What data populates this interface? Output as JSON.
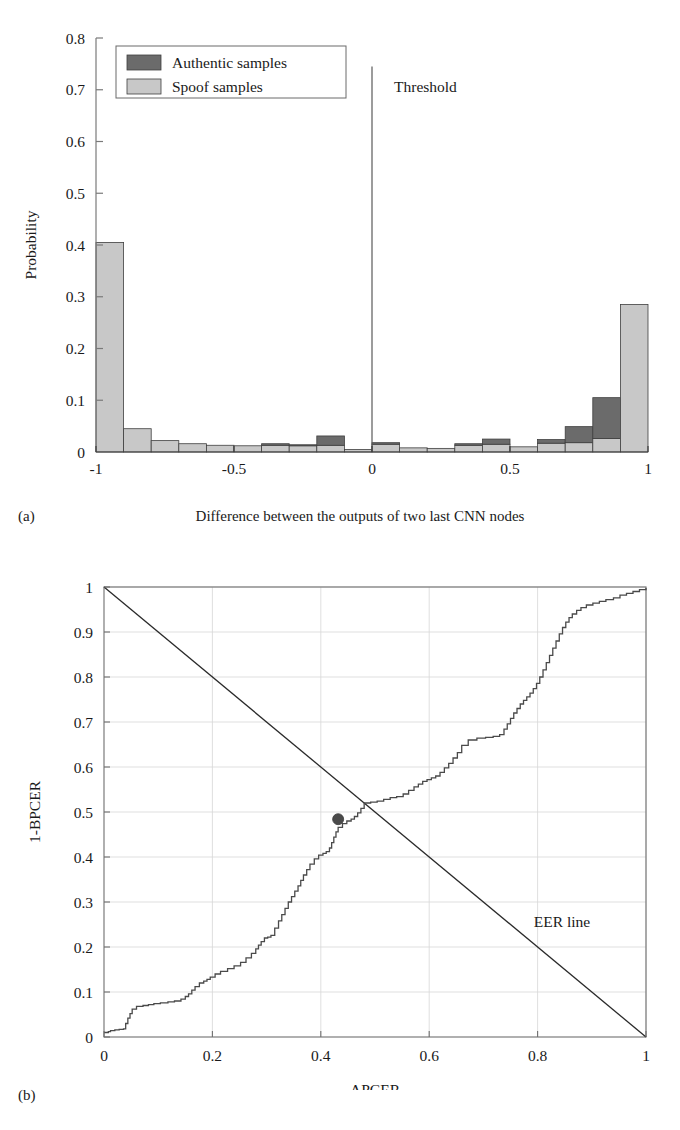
{
  "figure": {
    "panel_a": {
      "tag": "(a)",
      "caption": "Difference between the outputs of two last CNN nodes"
    },
    "panel_b": {
      "tag": "(b)",
      "caption": ""
    }
  },
  "chart_data": [
    {
      "id": "histogram-panel-a",
      "type": "bar",
      "title": "",
      "xlabel": "Difference between the outputs of two last CNN nodes",
      "ylabel": "Probability",
      "xlim": [
        -1,
        1
      ],
      "ylim": [
        0,
        0.8
      ],
      "grid": false,
      "stacked": true,
      "bin_width": 0.1,
      "x_ticks": [
        "-1",
        "-0.5",
        "0",
        "0.5",
        "1"
      ],
      "x_tick_values": [
        -1,
        -0.5,
        0,
        0.5,
        1
      ],
      "y_ticks": [
        "0",
        "0.1",
        "0.2",
        "0.3",
        "0.4",
        "0.5",
        "0.6",
        "0.7",
        "0.8"
      ],
      "y_tick_values": [
        0,
        0.1,
        0.2,
        0.3,
        0.4,
        0.5,
        0.6,
        0.7,
        0.8
      ],
      "bin_centers": [
        -0.95,
        -0.85,
        -0.75,
        -0.65,
        -0.55,
        -0.45,
        -0.35,
        -0.25,
        -0.15,
        -0.05,
        0.05,
        0.15,
        0.25,
        0.35,
        0.45,
        0.55,
        0.65,
        0.75,
        0.85,
        0.95
      ],
      "bin_edges": [
        -1,
        -0.9,
        -0.8,
        -0.7,
        -0.6,
        -0.5,
        -0.4,
        -0.3,
        -0.2,
        -0.1,
        0,
        0.1,
        0.2,
        0.3,
        0.4,
        0.5,
        0.6,
        0.7,
        0.8,
        0.9,
        1
      ],
      "series": [
        {
          "name": "Spoof samples",
          "color": "#c8c8c8",
          "values": [
            0.405,
            0.045,
            0.022,
            0.016,
            0.013,
            0.012,
            0.013,
            0.012,
            0.013,
            0.005,
            0.015,
            0.008,
            0.007,
            0.013,
            0.015,
            0.01,
            0.017,
            0.018,
            0.026,
            0.285
          ]
        },
        {
          "name": "Authentic samples",
          "color": "#6b6b6b",
          "values": [
            0.0,
            0.0,
            0.0,
            0.0,
            0.0,
            0.0,
            0.003,
            0.002,
            0.018,
            0.0,
            0.003,
            0.0,
            0.0,
            0.003,
            0.01,
            0.0,
            0.007,
            0.031,
            0.079,
            0.0
          ]
        }
      ],
      "legend": {
        "position": "top-left",
        "entries": [
          {
            "label": "Authentic samples",
            "color": "#6b6b6b"
          },
          {
            "label": "Spoof samples",
            "color": "#c8c8c8"
          }
        ]
      },
      "annotations": [
        {
          "name": "threshold-line",
          "label": "Threshold",
          "x": 0.0,
          "y_from": 0.0,
          "y_to": 0.745
        }
      ]
    },
    {
      "id": "det-panel-b",
      "type": "line",
      "title": "",
      "xlabel": "APCER",
      "ylabel": "1-BPCER",
      "xlim": [
        0,
        1
      ],
      "ylim": [
        0,
        1
      ],
      "grid": true,
      "x_ticks": [
        "0",
        "0.2",
        "0.4",
        "0.6",
        "0.8",
        "1"
      ],
      "x_tick_values": [
        0,
        0.2,
        0.4,
        0.6,
        0.8,
        1
      ],
      "y_ticks": [
        "0",
        "0.1",
        "0.2",
        "0.3",
        "0.4",
        "0.5",
        "0.6",
        "0.7",
        "0.8",
        "0.9",
        "1"
      ],
      "y_tick_values": [
        0,
        0.1,
        0.2,
        0.3,
        0.4,
        0.5,
        0.6,
        0.7,
        0.8,
        0.9,
        1
      ],
      "series": [
        {
          "name": "DET curve",
          "color": "#4a4a4a",
          "drawstyle": "steps-post",
          "x": [
            0.0,
            0.008,
            0.012,
            0.02,
            0.028,
            0.036,
            0.04,
            0.044,
            0.048,
            0.052,
            0.06,
            0.072,
            0.082,
            0.092,
            0.104,
            0.118,
            0.13,
            0.142,
            0.15,
            0.156,
            0.162,
            0.168,
            0.176,
            0.184,
            0.19,
            0.196,
            0.205,
            0.215,
            0.228,
            0.24,
            0.252,
            0.262,
            0.272,
            0.28,
            0.285,
            0.29,
            0.296,
            0.302,
            0.308,
            0.315,
            0.322,
            0.328,
            0.334,
            0.34,
            0.346,
            0.352,
            0.358,
            0.363,
            0.368,
            0.374,
            0.38,
            0.388,
            0.396,
            0.404,
            0.41,
            0.416,
            0.42,
            0.424,
            0.428,
            0.432,
            0.44,
            0.448,
            0.456,
            0.462,
            0.468,
            0.474,
            0.48,
            0.492,
            0.504,
            0.516,
            0.528,
            0.54,
            0.552,
            0.562,
            0.572,
            0.58,
            0.588,
            0.596,
            0.604,
            0.612,
            0.62,
            0.628,
            0.636,
            0.644,
            0.652,
            0.66,
            0.672,
            0.688,
            0.704,
            0.718,
            0.73,
            0.738,
            0.744,
            0.75,
            0.756,
            0.762,
            0.768,
            0.774,
            0.78,
            0.786,
            0.792,
            0.798,
            0.804,
            0.81,
            0.816,
            0.822,
            0.828,
            0.834,
            0.84,
            0.846,
            0.852,
            0.858,
            0.864,
            0.872,
            0.88,
            0.89,
            0.902,
            0.914,
            0.926,
            0.94,
            0.952,
            0.964,
            0.976,
            0.988,
            1.0
          ],
          "y": [
            0.01,
            0.012,
            0.014,
            0.016,
            0.017,
            0.018,
            0.03,
            0.042,
            0.052,
            0.062,
            0.068,
            0.07,
            0.072,
            0.074,
            0.076,
            0.078,
            0.08,
            0.084,
            0.09,
            0.096,
            0.104,
            0.112,
            0.12,
            0.124,
            0.128,
            0.133,
            0.14,
            0.146,
            0.152,
            0.158,
            0.166,
            0.176,
            0.186,
            0.196,
            0.204,
            0.212,
            0.22,
            0.222,
            0.226,
            0.242,
            0.258,
            0.272,
            0.286,
            0.3,
            0.312,
            0.324,
            0.336,
            0.348,
            0.36,
            0.372,
            0.384,
            0.396,
            0.404,
            0.408,
            0.412,
            0.42,
            0.432,
            0.444,
            0.456,
            0.466,
            0.474,
            0.48,
            0.484,
            0.49,
            0.498,
            0.508,
            0.52,
            0.522,
            0.524,
            0.528,
            0.532,
            0.534,
            0.54,
            0.548,
            0.556,
            0.562,
            0.568,
            0.572,
            0.576,
            0.58,
            0.588,
            0.598,
            0.608,
            0.62,
            0.632,
            0.648,
            0.66,
            0.664,
            0.666,
            0.668,
            0.672,
            0.684,
            0.696,
            0.708,
            0.72,
            0.73,
            0.74,
            0.748,
            0.756,
            0.764,
            0.774,
            0.786,
            0.8,
            0.816,
            0.832,
            0.848,
            0.864,
            0.88,
            0.896,
            0.91,
            0.922,
            0.932,
            0.94,
            0.948,
            0.954,
            0.96,
            0.964,
            0.968,
            0.972,
            0.976,
            0.982,
            0.986,
            0.99,
            0.994,
            0.998,
            1.0
          ]
        },
        {
          "name": "EER line",
          "color": "#2a2a2a",
          "drawstyle": "straight",
          "x": [
            0,
            1
          ],
          "y": [
            1,
            0
          ]
        }
      ],
      "markers": [
        {
          "name": "eer-point",
          "x": 0.432,
          "y": 0.484,
          "color": "#4a4a4a",
          "size": 11
        }
      ],
      "annotations": [
        {
          "name": "eer-line-label",
          "label": "EER line",
          "x": 0.845,
          "y": 0.245
        }
      ]
    }
  ]
}
